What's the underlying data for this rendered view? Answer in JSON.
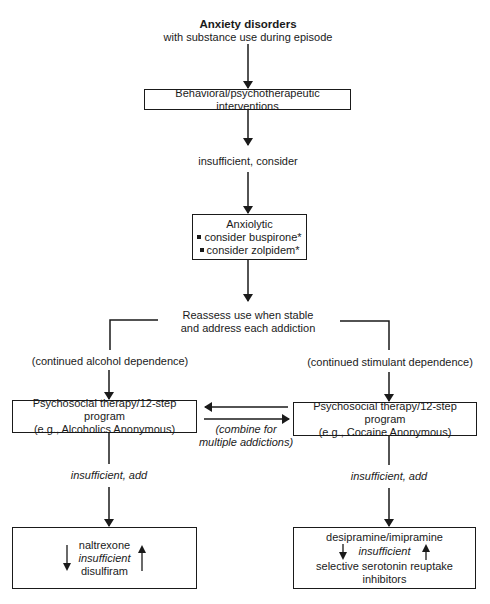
{
  "title": {
    "heading": "Anxiety disorders",
    "subheading": "with substance use during episode"
  },
  "steps": {
    "behavioral": "Behavioral/psychotherapeutic interventions",
    "insufficient_consider": "insufficient, consider",
    "anxiolytic": {
      "title": "Anxiolytic",
      "items": [
        "consider buspirone*",
        "consider zolpidem*"
      ]
    },
    "reassess": {
      "line1": "Reassess use when stable",
      "line2": "and address each addiction"
    }
  },
  "branches": {
    "left": {
      "condition": "(continued alcohol dependence)",
      "therapy_line1": "Psychosocial therapy/12-step program",
      "therapy_line2": "(e.g., Alcoholics Anonymous)",
      "insufficient_add": "insufficient, add",
      "meds": {
        "first": "naltrexone",
        "middle": "insufficient",
        "second": "disulfiram"
      }
    },
    "right": {
      "condition": "(continued stimulant dependence)",
      "therapy_line1": "Psychosocial therapy/12-step program",
      "therapy_line2": "(e.g., Cocaine Anonymous)",
      "insufficient_add": "insufficient, add",
      "meds": {
        "first": "desipramine/imipramine",
        "middle": "insufficient",
        "second": "selective serotonin reuptake inhibitors"
      }
    },
    "combine": {
      "line1": "(combine for",
      "line2": "multiple addictions)"
    }
  },
  "colors": {
    "line": "#1a1a1a",
    "background": "#ffffff"
  }
}
